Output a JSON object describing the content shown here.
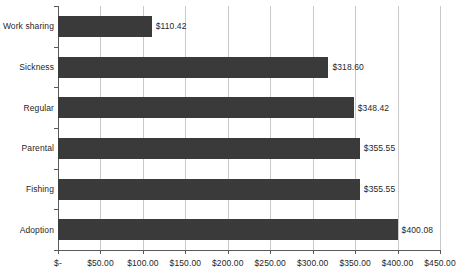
{
  "chart_data": {
    "type": "bar",
    "orientation": "horizontal",
    "title": "",
    "subtitle": "",
    "xlabel": "",
    "ylabel": "",
    "categories": [
      "Work sharing",
      "Sickness",
      "Regular",
      "Parental",
      "Fishing",
      "Adoption"
    ],
    "values": [
      110.42,
      318.6,
      348.42,
      355.55,
      355.55,
      400.08
    ],
    "value_labels": [
      "$110.42",
      "$318.60",
      "$348.42",
      "$355.55",
      "$355.55",
      "$400.08"
    ],
    "xlim": [
      0,
      450
    ],
    "xtick_values": [
      0,
      50,
      100,
      150,
      200,
      250,
      300,
      350,
      400,
      450
    ],
    "xtick_labels": [
      "$-",
      "$50.00",
      "$100.00",
      "$150.00",
      "$200.00",
      "$250.00",
      "$300.00",
      "$350.00",
      "$400.00",
      "$450.00"
    ],
    "grid": true,
    "grid_axis": "x",
    "legend": false,
    "legend_position": "none",
    "bar_color": "#3a3a3a",
    "gridline_color": "#c9c9c9",
    "axis_color": "#5a5a5a",
    "background_color": "#ffffff",
    "text_color": "#1f1f1f"
  }
}
